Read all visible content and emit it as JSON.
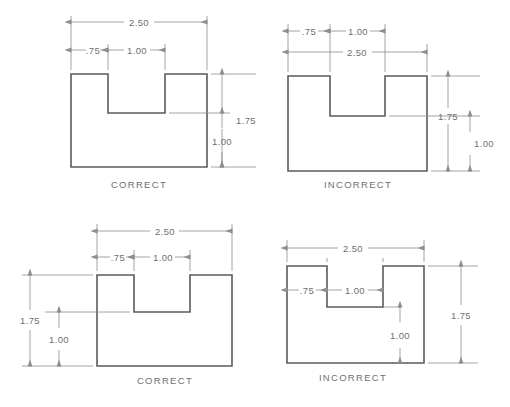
{
  "sheet": {
    "background_color": "#ffffff",
    "line_color": "#5b5b5b",
    "dim_color": "#8e8e8e",
    "text_color": "#6f6f6f",
    "title": "Dimension Placement Practice — Correct vs Incorrect"
  },
  "figures": [
    {
      "id": "top-left",
      "caption": "CORRECT",
      "dimensions": {
        "overall_width": "2.50",
        "left_step": ".75",
        "notch_width": "1.00",
        "overall_height": "1.75",
        "notch_depth_remainder": "1.00"
      }
    },
    {
      "id": "top-right",
      "caption": "INCORRECT",
      "dimensions": {
        "overall_width": "2.50",
        "left_step": ".75",
        "notch_width": "1.00",
        "overall_height": "1.75",
        "notch_depth_remainder": "1.00"
      }
    },
    {
      "id": "bottom-left",
      "caption": "CORRECT",
      "dimensions": {
        "overall_width": "2.50",
        "left_step": ".75",
        "notch_width": "1.00",
        "overall_height": "1.75",
        "notch_depth_remainder": "1.00"
      }
    },
    {
      "id": "bottom-right",
      "caption": "INCORRECT",
      "dimensions": {
        "overall_width": "2.50",
        "left_step": ".75",
        "notch_width": "1.00",
        "overall_height": "1.75",
        "notch_depth_remainder": "1.00"
      }
    }
  ]
}
